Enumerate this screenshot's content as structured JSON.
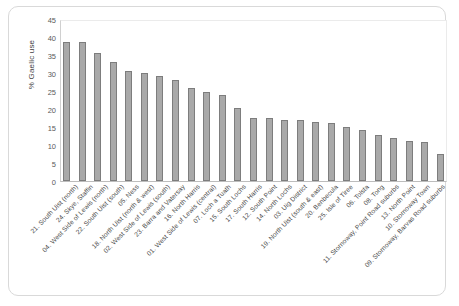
{
  "chart_data": {
    "type": "bar",
    "title": "",
    "xlabel": "",
    "ylabel": "% Gaelic use",
    "ylim": [
      0,
      45
    ],
    "yticks": [
      0,
      5,
      10,
      15,
      20,
      25,
      30,
      35,
      40,
      45
    ],
    "grid": false,
    "legend": null,
    "bar_color": "#a9a9a9",
    "bar_edge_color": "#7d7d7d",
    "categories": [
      "21. South Uist (north)",
      "24. Skye, Staffin",
      "04. West Side of Lewis (north)",
      "22. South Uist (south)",
      "05. Ness",
      "18. North Uist (north & west)",
      "02. West Side of Lewis (south)",
      "23. Barra and Vatersay",
      "16. North Harris",
      "01. West Side of Lewis (central)",
      "07. Loch a Tuath",
      "15. South Lochs",
      "17. South Harris",
      "12. South Point",
      "14. North Lochs",
      "03. Uig District",
      "19. North Uist (south & east)",
      "20. Benbecula",
      "25. Isle of Tiree",
      "06. Tolsta",
      "08. Tong",
      "11. Stornoway, Point Road suburbs",
      "13. North Point",
      "10. Stornoway Town",
      "09. Stornoway, Barvas Road suburbs"
    ],
    "values": [
      39.2,
      39.1,
      36.0,
      33.4,
      31.0,
      30.3,
      29.4,
      28.3,
      26.2,
      25.0,
      24.3,
      20.5,
      17.8,
      17.6,
      17.3,
      17.2,
      16.6,
      16.4,
      15.3,
      14.3,
      12.9,
      12.2,
      11.3,
      11.0,
      7.5
    ]
  }
}
